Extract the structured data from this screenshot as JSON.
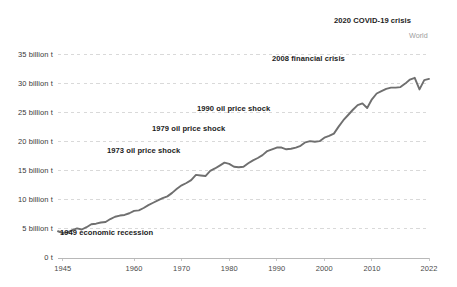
{
  "chart_data": {
    "type": "line",
    "title": "",
    "xlabel": "",
    "ylabel": "",
    "grid": true,
    "legend_position": "inline-right",
    "xlim": [
      1944,
      2022
    ],
    "ylim": [
      0,
      37.5
    ],
    "x_ticks": [
      {
        "value": 1945,
        "label": "1945"
      },
      {
        "value": 1960,
        "label": "1960"
      },
      {
        "value": 1970,
        "label": "1970"
      },
      {
        "value": 1980,
        "label": "1980"
      },
      {
        "value": 1990,
        "label": "1990"
      },
      {
        "value": 2000,
        "label": "2000"
      },
      {
        "value": 2010,
        "label": "2010"
      },
      {
        "value": 2022,
        "label": "2022"
      }
    ],
    "y_ticks": [
      {
        "value": 0,
        "label": "0 t"
      },
      {
        "value": 5,
        "label": "5 billion t"
      },
      {
        "value": 10,
        "label": "10 billion t"
      },
      {
        "value": 15,
        "label": "15 billion t"
      },
      {
        "value": 20,
        "label": "20 billion t"
      },
      {
        "value": 25,
        "label": "25 billion t"
      },
      {
        "value": 30,
        "label": "30 billion t"
      },
      {
        "value": 35,
        "label": "35 billion t"
      }
    ],
    "series": [
      {
        "name": "World",
        "color": "#6f6f6f",
        "x": [
          1944,
          1945,
          1946,
          1947,
          1948,
          1949,
          1950,
          1951,
          1952,
          1953,
          1954,
          1955,
          1956,
          1957,
          1958,
          1959,
          1960,
          1961,
          1962,
          1963,
          1964,
          1965,
          1966,
          1967,
          1968,
          1969,
          1970,
          1971,
          1972,
          1973,
          1974,
          1975,
          1976,
          1977,
          1978,
          1979,
          1980,
          1981,
          1982,
          1983,
          1984,
          1985,
          1986,
          1987,
          1988,
          1989,
          1990,
          1991,
          1992,
          1993,
          1994,
          1995,
          1996,
          1997,
          1998,
          1999,
          2000,
          2001,
          2002,
          2003,
          2004,
          2005,
          2006,
          2007,
          2008,
          2009,
          2010,
          2011,
          2012,
          2013,
          2014,
          2015,
          2016,
          2017,
          2018,
          2019,
          2020,
          2021,
          2022
        ],
        "values": [
          4.6,
          4.3,
          4.4,
          4.8,
          5.1,
          4.9,
          5.3,
          5.8,
          5.9,
          6.1,
          6.2,
          6.7,
          7.1,
          7.3,
          7.4,
          7.7,
          8.1,
          8.2,
          8.6,
          9.1,
          9.5,
          9.9,
          10.3,
          10.6,
          11.2,
          11.9,
          12.5,
          12.9,
          13.4,
          14.3,
          14.2,
          14.1,
          15.0,
          15.4,
          15.9,
          16.4,
          16.2,
          15.7,
          15.6,
          15.7,
          16.3,
          16.8,
          17.2,
          17.7,
          18.4,
          18.7,
          19.0,
          19.0,
          18.7,
          18.8,
          19.0,
          19.3,
          19.9,
          20.1,
          20.0,
          20.1,
          20.7,
          21.0,
          21.4,
          22.6,
          23.7,
          24.6,
          25.5,
          26.3,
          26.6,
          25.8,
          27.3,
          28.3,
          28.7,
          29.1,
          29.3,
          29.3,
          29.4,
          30.0,
          30.7,
          31.0,
          29.0,
          30.6,
          30.8
        ]
      }
    ],
    "annotations": [
      {
        "text": "1949 economic recession",
        "x": 60,
        "y": 228
      },
      {
        "text": "1973 oil price shock",
        "x": 107,
        "y": 146
      },
      {
        "text": "1979 oil price shock",
        "x": 152,
        "y": 124
      },
      {
        "text": "1990 oil price shock",
        "x": 197,
        "y": 104
      },
      {
        "text": "2008 financial crisis",
        "x": 272,
        "y": 54
      },
      {
        "text": "2020 COVID-19 crisis",
        "x": 334,
        "y": 16
      }
    ],
    "series_label": {
      "text": "World",
      "x": 409,
      "y": 31
    }
  }
}
